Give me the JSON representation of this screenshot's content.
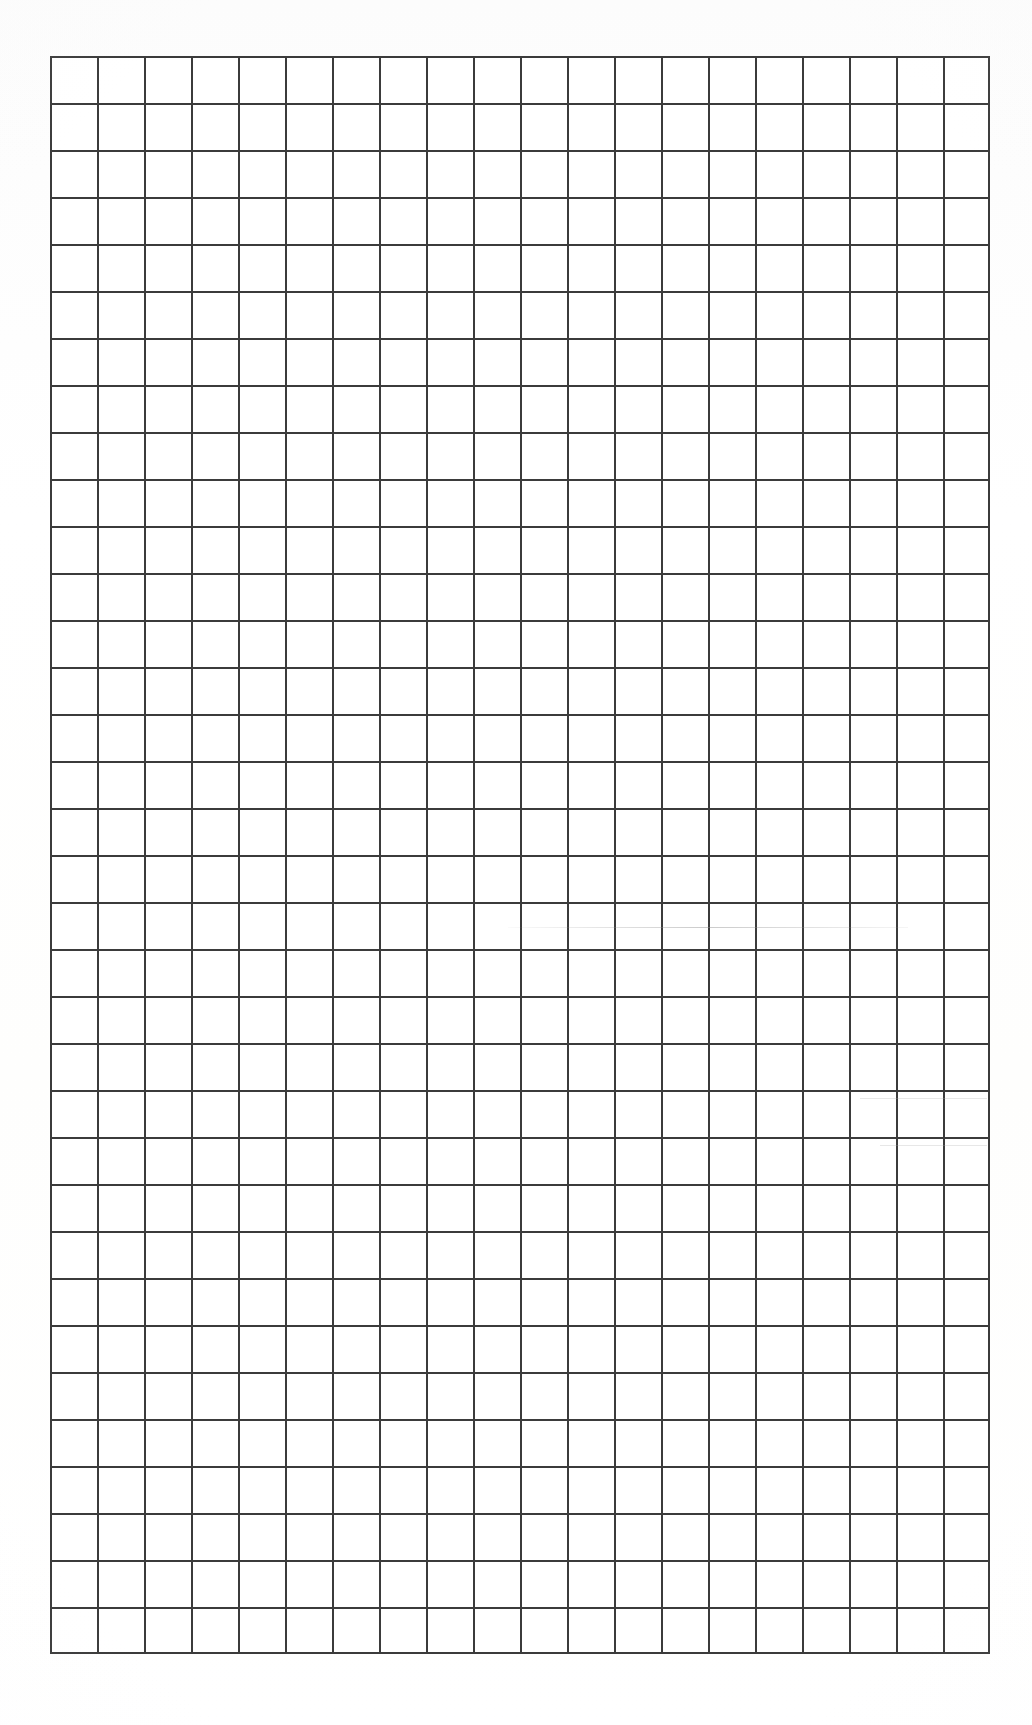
{
  "document": {
    "type": "scanned-grid-paper",
    "title": "Blank grid paper scan",
    "background_color": "#ffffff"
  },
  "grid": {
    "name": "ruled-grid",
    "columns": 20,
    "rows": 34,
    "cell_width_px": 47,
    "cell_height_px": 47,
    "line_color": "#3b3b3b",
    "line_width_px": 2,
    "origin_x_px": 50,
    "origin_y_px": 56,
    "width_px": 937,
    "height_px": 1584,
    "fill_color": "#ffffff",
    "content": ""
  },
  "artifacts": {
    "label": "scanner streaks",
    "streaks": [
      {
        "name": "streak-upper-right",
        "x": 508,
        "y": 927,
        "width": 400,
        "height": 1,
        "style": "fade"
      },
      {
        "name": "streak-right-edge",
        "x": 860,
        "y": 1098,
        "width": 127,
        "height": 1,
        "style": "soft"
      },
      {
        "name": "streak-right-lower",
        "x": 880,
        "y": 1145,
        "width": 107,
        "height": 1,
        "style": "soft"
      }
    ]
  }
}
